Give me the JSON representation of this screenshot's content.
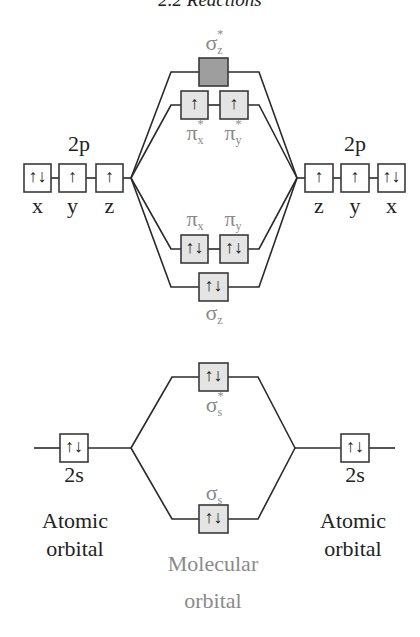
{
  "header": {
    "title": "2.2  Reactions"
  },
  "colors": {
    "line": "#2a2a2a",
    "box_fill": "#e4e4e4",
    "box_filled_antibonding": "#9e9e9e",
    "mo_label": "#8a8a8a",
    "ao_label": "#222222"
  },
  "left_atom": {
    "p_label": "2p",
    "p_orbitals": [
      {
        "axis": "x",
        "electrons": "⇅",
        "glyph": "↑↓"
      },
      {
        "axis": "y",
        "electrons": "↑",
        "glyph": "↑"
      },
      {
        "axis": "z",
        "electrons": "↑",
        "glyph": "↑"
      }
    ],
    "s_label": "2s",
    "s_orbital": {
      "glyph": "↑↓"
    },
    "caption_line1": "Atomic",
    "caption_line2": "orbital"
  },
  "right_atom": {
    "p_label": "2p",
    "p_orbitals": [
      {
        "axis": "z",
        "glyph": "↑"
      },
      {
        "axis": "y",
        "glyph": "↑"
      },
      {
        "axis": "x",
        "glyph": "↑↓"
      }
    ],
    "s_label": "2s",
    "s_orbital": {
      "glyph": "↑↓"
    },
    "caption_line1": "Atomic",
    "caption_line2": "orbital"
  },
  "molecular_orbitals": {
    "sigma_z_star": {
      "symbol": "σ",
      "sub": "z",
      "sup": "*",
      "glyph": ""
    },
    "pi_star": [
      {
        "symbol": "π",
        "sub": "x",
        "sup": "*",
        "glyph": "↑"
      },
      {
        "symbol": "π",
        "sub": "y",
        "sup": "*",
        "glyph": "↑"
      }
    ],
    "pi": [
      {
        "symbol": "π",
        "sub": "x",
        "glyph": "↑↓"
      },
      {
        "symbol": "π",
        "sub": "y",
        "glyph": "↑↓"
      }
    ],
    "sigma_z": {
      "symbol": "σ",
      "sub": "z",
      "glyph": "↑↓"
    },
    "sigma_s_star": {
      "symbol": "σ",
      "sub": "s",
      "sup": "*",
      "glyph": "↑↓"
    },
    "sigma_s": {
      "symbol": "σ",
      "sub": "s",
      "glyph": "↑↓"
    },
    "caption_line1": "Molecular",
    "caption_line2": "orbital"
  }
}
